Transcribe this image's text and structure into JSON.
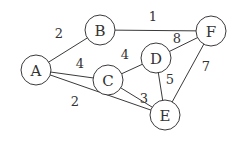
{
  "diagram": {
    "type": "weighted-undirected-graph",
    "nodes": [
      {
        "id": "A",
        "label": "A",
        "x": 36,
        "y": 70
      },
      {
        "id": "B",
        "label": "B",
        "x": 100,
        "y": 30
      },
      {
        "id": "C",
        "label": "C",
        "x": 108,
        "y": 80
      },
      {
        "id": "D",
        "label": "D",
        "x": 156,
        "y": 58
      },
      {
        "id": "E",
        "label": "E",
        "x": 165,
        "y": 115
      },
      {
        "id": "F",
        "label": "F",
        "x": 211,
        "y": 31
      }
    ],
    "edges": [
      {
        "from": "A",
        "to": "B",
        "weight": "2",
        "lx": 59,
        "ly": 33
      },
      {
        "from": "A",
        "to": "C",
        "weight": "4",
        "lx": 80,
        "ly": 63
      },
      {
        "from": "A",
        "to": "E",
        "weight": "2",
        "lx": 75,
        "ly": 101
      },
      {
        "from": "B",
        "to": "F",
        "weight": "1",
        "lx": 153,
        "ly": 16
      },
      {
        "from": "C",
        "to": "D",
        "weight": "4",
        "lx": 125,
        "ly": 54
      },
      {
        "from": "C",
        "to": "E",
        "weight": "3",
        "lx": 144,
        "ly": 98
      },
      {
        "from": "D",
        "to": "F",
        "weight": "8",
        "lx": 177,
        "ly": 38
      },
      {
        "from": "D",
        "to": "E",
        "weight": "5",
        "lx": 170,
        "ly": 79
      },
      {
        "from": "F",
        "to": "E",
        "weight": "7",
        "lx": 206,
        "ly": 66
      }
    ],
    "node_radius": 15,
    "stroke_color": "#3a3a3a",
    "text_color": "#333333"
  }
}
